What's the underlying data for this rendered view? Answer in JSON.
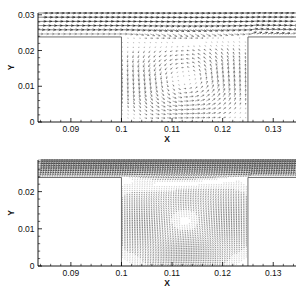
{
  "figure": {
    "panels": [
      {
        "id": "top",
        "name": "coarse-vector-field",
        "axes": {
          "xlabel": "X",
          "ylabel": "Y",
          "xticks": [
            "0.09",
            "0.1",
            "0.11",
            "0.12",
            "0.13"
          ],
          "xtickvals": [
            0.09,
            0.1,
            0.11,
            0.12,
            0.13
          ],
          "yticks": [
            "0",
            "0.01",
            "0.02",
            "0.03"
          ],
          "ytickvals": [
            0,
            0.01,
            0.02,
            0.03
          ],
          "xlim": [
            0.0835,
            0.1345
          ],
          "ylim": [
            0,
            0.0305
          ]
        },
        "geometry": {
          "cavity_left_x": 0.1,
          "cavity_right_x": 0.125,
          "cavity_floor_y": 0,
          "step_top_y": 0.0238
        },
        "density": "coarse"
      },
      {
        "id": "bottom",
        "name": "fine-vector-field",
        "axes": {
          "xlabel": "X",
          "ylabel": "Y",
          "xticks": [
            "0.09",
            "0.1",
            "0.11",
            "0.12",
            "0.13"
          ],
          "xtickvals": [
            0.09,
            0.1,
            0.11,
            0.12,
            0.13
          ],
          "yticks": [
            "0",
            "0.01",
            "0.02"
          ],
          "ytickvals": [
            0,
            0.01,
            0.02
          ],
          "xlim": [
            0.0835,
            0.1345
          ],
          "ylim": [
            0,
            0.0285
          ]
        },
        "geometry": {
          "cavity_left_x": 0.1,
          "cavity_right_x": 0.125,
          "cavity_floor_y": 0,
          "step_top_y": 0.0238
        },
        "density": "fine"
      }
    ]
  },
  "chart_data": {
    "type": "scatter",
    "title": "",
    "subtitle": "",
    "plot_kind": "vector-field-quiver",
    "panel_count": 2,
    "shared": {
      "xlabel": "X",
      "ylabel": "Y",
      "xlim": [
        0.0835,
        0.1345
      ],
      "xticks": [
        0.09,
        0.1,
        0.11,
        0.12,
        0.13
      ],
      "xticklabels": [
        "0.09",
        "0.1",
        "0.11",
        "0.12",
        "0.13"
      ],
      "grid": false,
      "legend": "none",
      "annotations": []
    },
    "panels": [
      {
        "name": "top-panel-coarse-grid",
        "ylim": [
          0,
          0.0305
        ],
        "yticks": [
          0,
          0.01,
          0.02,
          0.03
        ],
        "yticklabels": [
          "0",
          "0.01",
          "0.02",
          "0.03"
        ],
        "grid_nx": 40,
        "grid_ny": 22,
        "features": [
          "horizontal freestream boundary layer above y=0.024",
          "shear layer dips into cavity between x=0.1 and x=0.125",
          "single clockwise recirculation vortex inside cavity",
          "vortex center approximately x=0.1135, y=0.0115"
        ],
        "vortex_center": {
          "x": 0.1135,
          "y": 0.0115
        },
        "freestream_rows_y": [
          0.0295,
          0.0283,
          0.0272,
          0.0262,
          0.025,
          0.024
        ]
      },
      {
        "name": "bottom-panel-fine-grid",
        "ylim": [
          0,
          0.0285
        ],
        "yticks": [
          0,
          0.01,
          0.02
        ],
        "yticklabels": [
          "0",
          "0.01",
          "0.02"
        ],
        "grid_nx": 96,
        "grid_ny": 54,
        "features": [
          "dense dark freestream band above y=0.024",
          "strong shear layer penetration into cavity",
          "large clockwise recirculation filling the cavity",
          "vortex center approximately x=0.1140, y=0.0120"
        ],
        "vortex_center": {
          "x": 0.114,
          "y": 0.012
        },
        "freestream_rows_y": [
          0.0282,
          0.0275,
          0.0268,
          0.0261,
          0.0254,
          0.0247,
          0.024
        ]
      }
    ]
  }
}
